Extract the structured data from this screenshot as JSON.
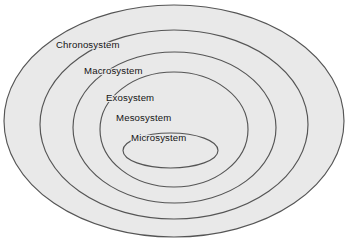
{
  "diagram": {
    "background_color": "#ffffff",
    "ring_fill_color": "#e9e9e9",
    "ring_stroke_color": "#555555",
    "label_color": "#141414",
    "rings": [
      {
        "label": "Chronosystem",
        "level": 1,
        "cx": 174,
        "cy": 121,
        "rx": 170,
        "ry": 116,
        "label_x": 56,
        "label_y": 48
      },
      {
        "label": "Macrosystem",
        "level": 2,
        "cx": 174,
        "cy": 124.5,
        "rx": 134,
        "ry": 94.5,
        "label_x": 84,
        "label_y": 74
      },
      {
        "label": "Exosystem",
        "level": 3,
        "cx": 174.5,
        "cy": 127.5,
        "rx": 101.5,
        "ry": 75.5,
        "label_x": 106,
        "label_y": 101
      },
      {
        "label": "Mesosystem",
        "level": 4,
        "cx": 174,
        "cy": 129.5,
        "rx": 74,
        "ry": 57.5,
        "label_x": 116,
        "label_y": 121
      },
      {
        "label": "Microsystem",
        "level": 5,
        "cx": 170.5,
        "cy": 150.5,
        "rx": 47.5,
        "ry": 17.5,
        "label_x": 131,
        "label_y": 141
      }
    ]
  }
}
